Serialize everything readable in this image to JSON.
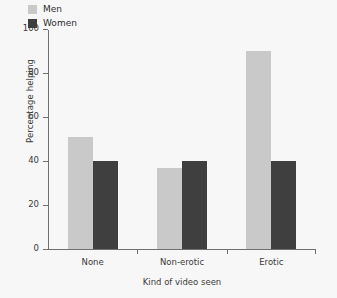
{
  "chart_data": {
    "type": "bar",
    "title": "",
    "xlabel": "Kind of video seen",
    "ylabel": "Percentage helping",
    "categories": [
      "None",
      "Non-erotic",
      "Erotic"
    ],
    "series": [
      {
        "name": "Men",
        "color": "#c9c9c9",
        "values": [
          51,
          37,
          90
        ]
      },
      {
        "name": "Women",
        "color": "#3f3f3f",
        "values": [
          40,
          40,
          40
        ]
      }
    ],
    "ylim": [
      0,
      100
    ],
    "yticks": [
      0,
      20,
      40,
      60,
      80,
      100
    ],
    "ytick_labels": [
      "0",
      "20",
      "40",
      "60",
      "80",
      "100"
    ],
    "grid": false,
    "legend_position": "upper-left-inside",
    "background_color": "#f7f7f7",
    "axis_color": "#6f6f6f",
    "text_color": "#3a3a3a"
  },
  "legend": {
    "entries": [
      {
        "label": "Men"
      },
      {
        "label": "Women"
      }
    ]
  }
}
